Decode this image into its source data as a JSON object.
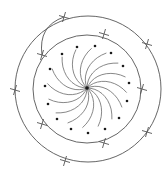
{
  "diagram": {
    "center": [
      87,
      88
    ],
    "inner_circle": {
      "cx": 87,
      "cy": 89,
      "r": 54
    },
    "outer_circle": {
      "cx": 88,
      "cy": 89,
      "r": 73
    },
    "upper_arc": {
      "from": [
        64,
        17
      ],
      "via": [
        44,
        28
      ],
      "to": [
        42,
        55
      ]
    },
    "outer_crosses": [
      [
        64,
        17
      ],
      [
        147,
        44
      ],
      [
        15,
        90
      ],
      [
        147,
        132
      ],
      [
        65,
        161
      ]
    ],
    "inner_crosses": [
      [
        104,
        34
      ],
      [
        42,
        55
      ],
      [
        142,
        89
      ],
      [
        42,
        124
      ],
      [
        104,
        143
      ]
    ],
    "dots": [
      [
        77,
        47
      ],
      [
        95,
        46
      ],
      [
        111,
        53
      ],
      [
        62,
        54
      ],
      [
        123,
        66
      ],
      [
        50,
        69
      ],
      [
        129,
        83
      ],
      [
        45,
        86
      ],
      [
        127,
        101
      ],
      [
        48,
        104
      ],
      [
        119,
        118
      ],
      [
        57,
        119
      ],
      [
        105,
        129
      ],
      [
        71,
        129
      ],
      [
        88,
        133
      ]
    ],
    "spiral_arm_count": 16,
    "colors": {
      "line": "#555555",
      "dot": "#1a1a1a",
      "background": "#ffffff"
    }
  }
}
